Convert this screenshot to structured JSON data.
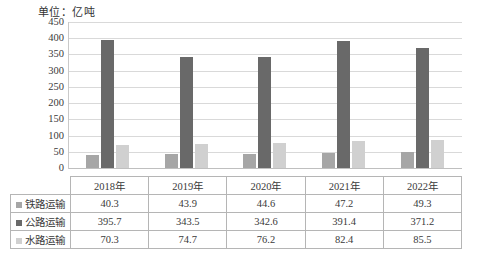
{
  "chart_data": {
    "type": "bar",
    "title": "单位：亿吨",
    "xlabel": "",
    "ylabel": "",
    "ylim": [
      0,
      450
    ],
    "ytick_step": 50,
    "yticks": [
      450,
      400,
      350,
      300,
      250,
      200,
      150,
      100,
      50,
      0
    ],
    "grid": true,
    "legend_position": "table-left",
    "categories": [
      "2018年",
      "2019年",
      "2020年",
      "2021年",
      "2022年"
    ],
    "series": [
      {
        "name": "铁路运输",
        "color": "#a6a6a6",
        "values": [
          40.3,
          43.9,
          44.6,
          47.2,
          49.3
        ]
      },
      {
        "name": "公路运输",
        "color": "#696969",
        "values": [
          395.7,
          343.5,
          342.6,
          391.4,
          371.2
        ]
      },
      {
        "name": "水路运输",
        "color": "#d0d0d0",
        "values": [
          70.3,
          74.7,
          76.2,
          82.4,
          85.5
        ]
      }
    ]
  },
  "table": {
    "header": [
      "",
      "2018年",
      "2019年",
      "2020年",
      "2021年",
      "2022年"
    ],
    "rows": [
      {
        "label": "铁路运输",
        "swatch": "s0",
        "cells": [
          "40.3",
          "43.9",
          "44.6",
          "47.2",
          "49.3"
        ]
      },
      {
        "label": "公路运输",
        "swatch": "s1",
        "cells": [
          "395.7",
          "343.5",
          "342.6",
          "391.4",
          "371.2"
        ]
      },
      {
        "label": "水路运输",
        "swatch": "s2",
        "cells": [
          "70.3",
          "74.7",
          "76.2",
          "82.4",
          "85.5"
        ]
      }
    ]
  }
}
